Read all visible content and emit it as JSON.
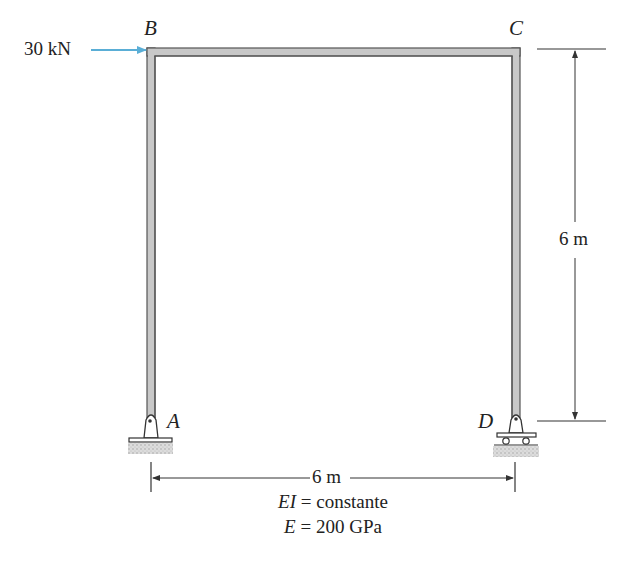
{
  "diagram": {
    "nodes": {
      "A": "A",
      "B": "B",
      "C": "C",
      "D": "D"
    },
    "load": {
      "label": "30 kN",
      "direction": "right",
      "node": "B",
      "color": "#5aaed6"
    },
    "dimensions": {
      "height": "6 m",
      "span": "6 m"
    },
    "properties": {
      "ei_prefix": "EI",
      "ei_text": " = constante",
      "e_prefix": "E",
      "e_text": " = 200 GPa"
    },
    "supports": {
      "A": "pin",
      "D": "roller"
    },
    "colors": {
      "member_fill": "#c8c8c8",
      "member_edge": "#555555",
      "ground": "#cfcfcf",
      "ink": "#222222"
    }
  }
}
